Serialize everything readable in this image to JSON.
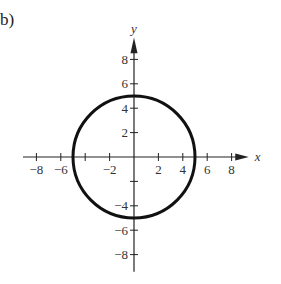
{
  "part_label": "b)",
  "chart_data": {
    "type": "line",
    "title": "",
    "xlabel": "x",
    "ylabel": "y",
    "xlim": [
      -9,
      9
    ],
    "ylim": [
      -9,
      9
    ],
    "x_ticks": [
      -8,
      -6,
      -4,
      -2,
      2,
      4,
      6,
      8
    ],
    "x_tick_labels": [
      "-8",
      "-6",
      "-2",
      "2",
      "4",
      "6",
      "8"
    ],
    "x_tick_label_values": [
      -8,
      -6,
      -2,
      2,
      4,
      6,
      8
    ],
    "y_ticks": [
      -8,
      -6,
      -4,
      -2,
      2,
      4,
      6,
      8
    ],
    "y_tick_labels": [
      "8",
      "6",
      "4",
      "2",
      "-4",
      "-6",
      "-8"
    ],
    "y_tick_label_values": [
      8,
      6,
      4,
      2,
      -4,
      -6,
      -8
    ],
    "grid": false,
    "series": [
      {
        "name": "circle",
        "shape": "circle",
        "center": [
          0,
          0
        ],
        "radius": 5
      }
    ]
  },
  "colors": {
    "curve": "#111111",
    "axis": "#222222"
  }
}
